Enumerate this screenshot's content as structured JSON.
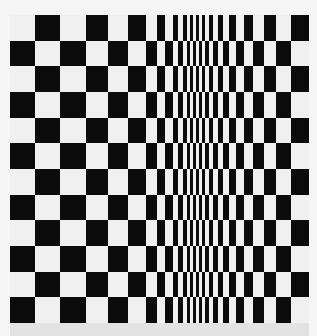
{
  "artwork": {
    "title": "",
    "colors": {
      "dark": "#0b0b0b",
      "light": "#f0f0f0",
      "strip": "#e3e3e3"
    },
    "rows": 12,
    "first_row_starts_with": "light",
    "column_edges": [
      0,
      25,
      50,
      76,
      98,
      118,
      136,
      147,
      155,
      163,
      168,
      173,
      177,
      180,
      183,
      186,
      189,
      192,
      195,
      199,
      203,
      208,
      213,
      219,
      226,
      234,
      243,
      254,
      266,
      281,
      299
    ]
  }
}
